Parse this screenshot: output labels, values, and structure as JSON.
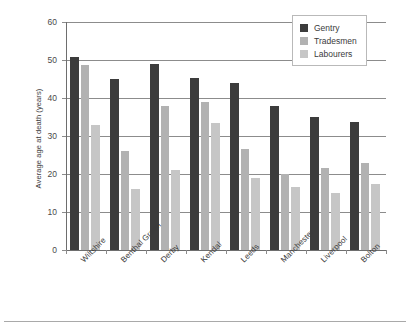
{
  "chart_data": {
    "type": "bar",
    "title": "",
    "xlabel": "",
    "ylabel": "Average age at death (years)",
    "ylim": [
      0,
      60
    ],
    "yticks": [
      0,
      10,
      20,
      30,
      40,
      50,
      60
    ],
    "ytick_labels": [
      "0",
      "10",
      "20",
      "30",
      "40",
      "50",
      "60"
    ],
    "grid": true,
    "legend_position": "top-right",
    "categories": [
      "Wiltshire",
      "Benthal Green",
      "Derby",
      "Kendal",
      "Leeds",
      "Manchester",
      "Liverpool",
      "Bolton"
    ],
    "series": [
      {
        "name": "Gentry",
        "color": "#3c3c3c",
        "values": [
          50.8,
          45.0,
          49.0,
          45.2,
          44.0,
          38.0,
          35.0,
          33.7
        ]
      },
      {
        "name": "Tradesmen",
        "color": "#b2b2b2",
        "values": [
          48.8,
          26.0,
          38.0,
          39.0,
          26.5,
          20.0,
          21.5,
          23.0
        ]
      },
      {
        "name": "Labourers",
        "color": "#c6c6c6",
        "values": [
          33.0,
          16.0,
          21.0,
          33.5,
          19.0,
          16.5,
          15.0,
          17.5
        ]
      }
    ]
  },
  "legend": {
    "items": [
      {
        "label": "Gentry"
      },
      {
        "label": "Tradesmen"
      },
      {
        "label": "Labourers"
      }
    ]
  },
  "colors": {
    "gentry": "#3c3c3c",
    "tradesmen": "#b2b2b2",
    "labourers": "#c6c6c6",
    "gridline": "#8c8c8c",
    "text": "#3b3b3b"
  }
}
